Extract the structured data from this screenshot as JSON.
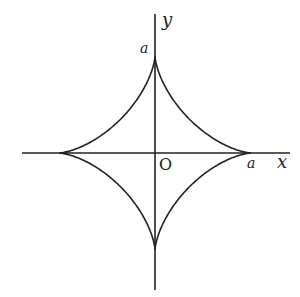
{
  "diagram": {
    "type": "astroid",
    "equation_hint": "x^(2/3) + y^(2/3) = a^(2/3)",
    "axes": {
      "x_label": "x",
      "y_label": "y",
      "origin_label": "O"
    },
    "cusp_labels": {
      "x_intercept": "a",
      "y_intercept": "a"
    },
    "colors": {
      "stroke": "#222222",
      "background": "#ffffff"
    }
  }
}
